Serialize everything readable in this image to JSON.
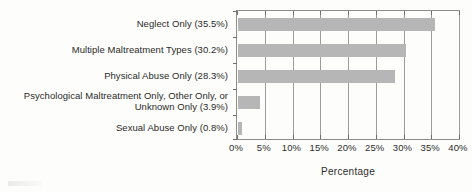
{
  "chart_data": {
    "type": "bar",
    "orientation": "horizontal",
    "title": "",
    "xlabel": "Percentage",
    "ylabel": "",
    "xlim": [
      0,
      40
    ],
    "xticks": [
      "0%",
      "5%",
      "10%",
      "15%",
      "20%",
      "25%",
      "30%",
      "35%",
      "40%"
    ],
    "xtick_values": [
      0,
      5,
      10,
      15,
      20,
      25,
      30,
      35,
      40
    ],
    "grid": "vertical",
    "legend": "none",
    "bar_color": "#b6b6b6",
    "frame_color": "#8d8d8d",
    "categories": [
      "Neglect Only (35.5%)",
      "Multiple Maltreatment Types (30.2%)",
      "Physical Abuse Only (28.3%)",
      "Psychological Maltreatment Only, Other Only, or Unknown Only (3.9%)",
      "Sexual Abuse Only (0.8%)"
    ],
    "values": [
      35.5,
      30.2,
      28.3,
      3.9,
      0.8
    ]
  }
}
